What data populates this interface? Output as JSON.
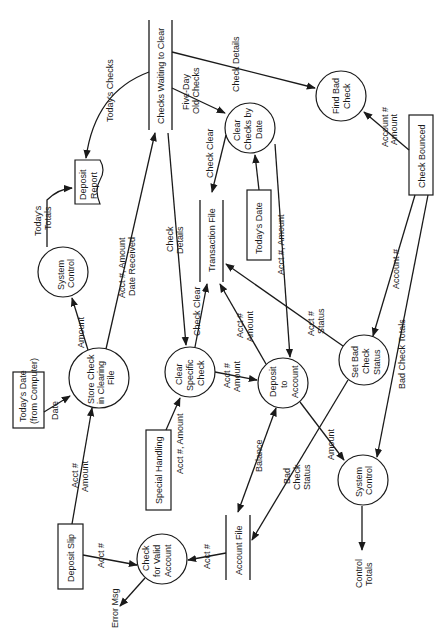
{
  "diagram": {
    "type": "data-flow-diagram",
    "orientation": "rotated-90-ccw",
    "processes": {
      "store_check": [
        "Store Check",
        "in Clearing",
        "File"
      ],
      "system_control_top": [
        "System",
        "Control"
      ],
      "clear_by_date": [
        "Clear",
        "Checks by",
        "Date"
      ],
      "find_bad_check": [
        "Find Bad",
        "Check"
      ],
      "clear_specific": [
        "Clear",
        "Specific",
        "Check"
      ],
      "deposit_to_account": [
        "Deposit",
        "to",
        "Account"
      ],
      "set_bad_check": [
        "Set Bad",
        "Check",
        "Status"
      ],
      "system_control_bottom": [
        "System",
        "Control"
      ],
      "check_valid": [
        "Check",
        "for Valid",
        "Account"
      ]
    },
    "external_entities": {
      "todays_date_computer": [
        "Today's Date",
        "(from Computer)"
      ],
      "todays_date": "Today's Date",
      "check_bounced": "Check Bounced",
      "special_handling": "Special Handling",
      "deposit_slip": "Deposit Slip"
    },
    "data_stores": {
      "checks_waiting": "Checks Waiting to Clear",
      "transaction_file": "Transaction File",
      "account_file": "Account File"
    },
    "documents": {
      "deposit_report": [
        "Deposit",
        "Report"
      ]
    },
    "flows": {
      "todays_checks": "Today's Checks",
      "todays_totals": [
        "Today's",
        "Totals"
      ],
      "check_details_top": "Check Details",
      "five_day": [
        "Five-Day",
        "Old Checks"
      ],
      "check_clear_1": "Check Clear",
      "account_amount": [
        "Account #",
        "Amount"
      ],
      "acct_amount_date": [
        "Acct #, Amount",
        "Date Received"
      ],
      "check_details_mid": [
        "Check",
        "Details"
      ],
      "check_clear_2": "Check Clear",
      "acct_amount_right": "Acct #, Amount",
      "amount_1": "Amount",
      "date": "Date",
      "acct_amount_1": [
        "Acct #",
        "Amount"
      ],
      "acct_amount_2": [
        "Acct #",
        "Amount"
      ],
      "acct_status": [
        "Acct #",
        "Status"
      ],
      "account_num": "Account #",
      "bad_check_totals": "Bad Check Totals",
      "acct_amount_deposit": [
        "Acct #",
        "Amount"
      ],
      "acct_amount_special": "Acct #, Amount",
      "balance": "Balance",
      "bad_check_status": [
        "Bad",
        "Check",
        "Status"
      ],
      "amount_2": "Amount",
      "acct_num_1": "Acct #",
      "acct_num_2": "Acct #",
      "error_msg": "Error Msg",
      "control_totals": [
        "Control",
        "Totals"
      ]
    }
  }
}
